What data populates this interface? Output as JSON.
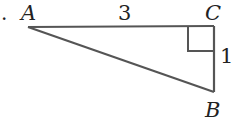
{
  "diagram": {
    "type": "right-triangle",
    "bullet": ".",
    "vertices": {
      "A": {
        "label": "A",
        "x": 28,
        "y": 27
      },
      "B": {
        "label": "B",
        "x": 214,
        "y": 92
      },
      "C": {
        "label": "C",
        "x": 214,
        "y": 26
      }
    },
    "sides": {
      "AC": {
        "label": "3"
      },
      "CB": {
        "label": "1"
      }
    },
    "right_angle_at": "C",
    "colors": {
      "stroke": "#555555",
      "text": "#222222"
    }
  }
}
